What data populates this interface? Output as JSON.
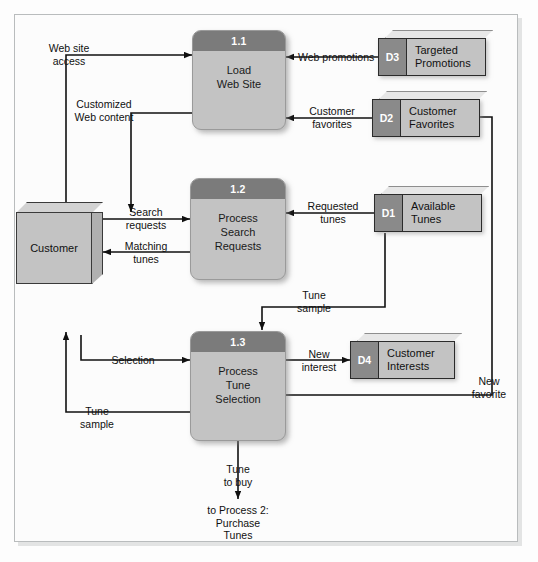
{
  "diagram": {
    "colors": {
      "process_fill": "#c3c3c3",
      "process_header": "#7b7b7b",
      "store_fill": "#c3c3c3",
      "store_id_fill": "#8a8a8a",
      "entity_fill": "#c3c3c3",
      "line": "#111111",
      "frame": "#b9bcbd"
    }
  },
  "processes": [
    {
      "number": "1.1",
      "name": "Load\nWeb Site",
      "line1": "Load",
      "line2": "Web Site",
      "line3": ""
    },
    {
      "number": "1.2",
      "name": "Process Search Requests",
      "line1": "Process",
      "line2": "Search",
      "line3": "Requests"
    },
    {
      "number": "1.3",
      "name": "Process Tune Selection",
      "line1": "Process",
      "line2": "Tune",
      "line3": "Selection"
    }
  ],
  "data_stores": [
    {
      "id": "D3",
      "line1": "Targeted",
      "line2": "Promotions"
    },
    {
      "id": "D2",
      "line1": "Customer",
      "line2": "Favorites"
    },
    {
      "id": "D1",
      "line1": "Available",
      "line2": "Tunes"
    },
    {
      "id": "D4",
      "line1": "Customer",
      "line2": "Interests"
    }
  ],
  "entities": [
    {
      "name": "Customer"
    }
  ],
  "flows": [
    {
      "id": "web-site-access",
      "line1": "Web site",
      "line2": "access"
    },
    {
      "id": "customized-web-content",
      "line1": "Customized",
      "line2": "Web content"
    },
    {
      "id": "web-promotions",
      "line1": "Web promotions",
      "line2": ""
    },
    {
      "id": "customer-favorites",
      "line1": "Customer",
      "line2": "favorites"
    },
    {
      "id": "search-requests",
      "line1": "Search",
      "line2": "requests"
    },
    {
      "id": "matching-tunes",
      "line1": "Matching",
      "line2": "tunes"
    },
    {
      "id": "requested-tunes",
      "line1": "Requested",
      "line2": "tunes"
    },
    {
      "id": "tune-sample-top",
      "line1": "Tune",
      "line2": "sample"
    },
    {
      "id": "selection",
      "line1": "Selection",
      "line2": ""
    },
    {
      "id": "new-interest",
      "line1": "New",
      "line2": "interest"
    },
    {
      "id": "tune-sample-left",
      "line1": "Tune",
      "line2": "sample"
    },
    {
      "id": "new-favorite",
      "line1": "New",
      "line2": "favorite"
    },
    {
      "id": "tune-to-buy",
      "line1": "Tune",
      "line2": "to buy"
    }
  ],
  "terminator": {
    "line1": "to Process 2:",
    "line2": "Purchase",
    "line3": "Tunes"
  }
}
